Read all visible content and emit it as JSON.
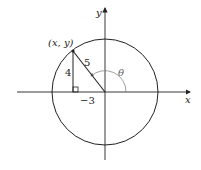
{
  "diagram": {
    "type": "unit-circle-angle",
    "labels": {
      "point": "(x, y)",
      "hypotenuse": "5",
      "vertical_leg": "4",
      "horizontal_leg": "−3",
      "angle": "θ",
      "x_axis": "x",
      "y_axis": "y"
    },
    "geometry": {
      "origin": [
        105,
        92
      ],
      "radius": 53,
      "point": [
        73,
        51
      ]
    },
    "colors": {
      "stroke": "#222222",
      "angle_arc": "#777777"
    }
  }
}
